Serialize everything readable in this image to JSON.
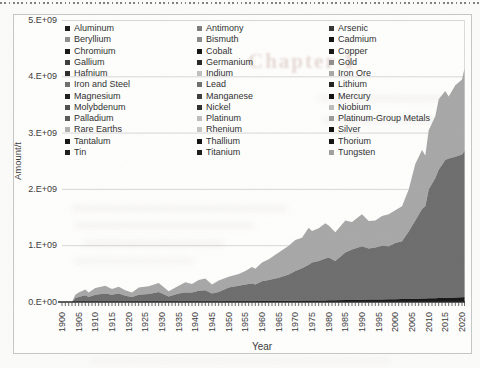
{
  "page": {
    "ghost_text": "Chapter 1"
  },
  "chart": {
    "y_axis": {
      "title": "Amount/t",
      "tick_labels": [
        "0.E+00",
        "1.E+09",
        "2.E+09",
        "3.E+09",
        "4.E+09",
        "5.E+09"
      ],
      "tick_values": [
        0,
        1,
        2,
        3,
        4,
        5
      ]
    },
    "x_axis": {
      "title": "Year",
      "tick_labels": [
        "1900",
        "1905",
        "1910",
        "1915",
        "1920",
        "1925",
        "1930",
        "1935",
        "1940",
        "1945",
        "1950",
        "1955",
        "1960",
        "1965",
        "1970",
        "1975",
        "1980",
        "1985",
        "1990",
        "1995",
        "2000",
        "2005",
        "2010",
        "2015",
        "2020"
      ]
    },
    "legend": {
      "columns": [
        [
          {
            "label": "Aluminum",
            "color": "#1a1a1a"
          },
          {
            "label": "Beryllium",
            "color": "#8f8f8f"
          },
          {
            "label": "Chromium",
            "color": "#161616"
          },
          {
            "label": "Gallium",
            "color": "#3d3d3d"
          },
          {
            "label": "Hafnium",
            "color": "#2b2b2b"
          },
          {
            "label": "Iron and Steel",
            "color": "#6f6f6f"
          },
          {
            "label": "Magnesium",
            "color": "#1f1f1f"
          },
          {
            "label": "Molybdenum",
            "color": "#4f4f4f"
          },
          {
            "label": "Palladium",
            "color": "#5a5a5a"
          },
          {
            "label": "Rare Earths",
            "color": "#b0b0b0"
          },
          {
            "label": "Tantalum",
            "color": "#141414"
          },
          {
            "label": "Tin",
            "color": "#1c1c1c"
          }
        ],
        [
          {
            "label": "Antimony",
            "color": "#7d7d7d"
          },
          {
            "label": "Bismuth",
            "color": "#8a8a8a"
          },
          {
            "label": "Cobalt",
            "color": "#121212"
          },
          {
            "label": "Germanium",
            "color": "#262626"
          },
          {
            "label": "Indium",
            "color": "#c0c0c0"
          },
          {
            "label": "Lead",
            "color": "#6f6f6f"
          },
          {
            "label": "Manganese",
            "color": "#3c3c3c"
          },
          {
            "label": "Nickel",
            "color": "#2f2f2f"
          },
          {
            "label": "Platinum",
            "color": "#bdbdbd"
          },
          {
            "label": "Rhenium",
            "color": "#c4c4c4"
          },
          {
            "label": "Thallium",
            "color": "#101010"
          },
          {
            "label": "Titanium",
            "color": "#1b1b1b"
          }
        ],
        [
          {
            "label": "Arsenic",
            "color": "#353535"
          },
          {
            "label": "Cadmium",
            "color": "#101010"
          },
          {
            "label": "Copper",
            "color": "#141414"
          },
          {
            "label": "Gold",
            "color": "#8f8f8f"
          },
          {
            "label": "Iron Ore",
            "color": "#a8a8a8"
          },
          {
            "label": "Lithium",
            "color": "#202020"
          },
          {
            "label": "Mercury",
            "color": "#0f0f0f"
          },
          {
            "label": "Niobium",
            "color": "#bdbdbd"
          },
          {
            "label": "Platinum-Group Metals",
            "color": "#9a9a9a"
          },
          {
            "label": "Silver",
            "color": "#0d0d0d"
          },
          {
            "label": "Thorium",
            "color": "#121212"
          },
          {
            "label": "Tungsten",
            "color": "#9f9f9f"
          }
        ]
      ]
    }
  },
  "chart_data": {
    "type": "area",
    "stacked": true,
    "title": "",
    "xlabel": "Year",
    "ylabel": "Amount/t",
    "xlim": [
      1900,
      2021
    ],
    "ylim": [
      0,
      5000000000
    ],
    "y_tick_format": "0.E+00",
    "values_unit": "1e9 tonnes",
    "grid": true,
    "legend_position": "inside-top",
    "legend_entries": [
      "Aluminum",
      "Antimony",
      "Arsenic",
      "Beryllium",
      "Bismuth",
      "Cadmium",
      "Chromium",
      "Cobalt",
      "Copper",
      "Gallium",
      "Germanium",
      "Gold",
      "Hafnium",
      "Indium",
      "Iron and Steel",
      "Iron Ore",
      "Lead",
      "Lithium",
      "Magnesium",
      "Manganese",
      "Mercury",
      "Molybdenum",
      "Nickel",
      "Niobium",
      "Palladium",
      "Platinum",
      "Platinum-Group Metals",
      "Rare Earths",
      "Rhenium",
      "Silver",
      "Tantalum",
      "Thallium",
      "Thorium",
      "Tin",
      "Titanium",
      "Tungsten"
    ],
    "note": "36 stacked series in legend; only three bands are visually resolvable in the plot (values estimated from pixels, in 1e9 t): thin black bottom band (Aluminum and other minor metals), dark gray Iron and Steel, light gray Iron Ore.",
    "x": [
      1900,
      1903,
      1904,
      1905,
      1907,
      1908,
      1910,
      1913,
      1915,
      1917,
      1919,
      1921,
      1923,
      1926,
      1929,
      1932,
      1935,
      1937,
      1939,
      1941,
      1943,
      1945,
      1947,
      1950,
      1953,
      1955,
      1957,
      1958,
      1960,
      1962,
      1965,
      1968,
      1970,
      1972,
      1974,
      1975,
      1977,
      1979,
      1980,
      1982,
      1985,
      1987,
      1990,
      1992,
      1994,
      1996,
      1998,
      2000,
      2002,
      2004,
      2006,
      2008,
      2009,
      2010,
      2012,
      2013,
      2015,
      2016,
      2018,
      2020,
      2021
    ],
    "series": [
      {
        "name": "Other metals (bottom black band)",
        "color": "#151515",
        "values": [
          0,
          0,
          0.005,
          0.005,
          0.005,
          0.005,
          0.006,
          0.006,
          0.006,
          0.006,
          0.006,
          0.007,
          0.007,
          0.007,
          0.008,
          0.008,
          0.009,
          0.009,
          0.01,
          0.01,
          0.01,
          0.011,
          0.011,
          0.012,
          0.013,
          0.014,
          0.015,
          0.015,
          0.016,
          0.017,
          0.019,
          0.021,
          0.022,
          0.024,
          0.026,
          0.027,
          0.028,
          0.029,
          0.03,
          0.032,
          0.035,
          0.037,
          0.04,
          0.042,
          0.044,
          0.046,
          0.048,
          0.05,
          0.052,
          0.054,
          0.057,
          0.06,
          0.062,
          0.065,
          0.068,
          0.07,
          0.075,
          0.077,
          0.08,
          0.085,
          0.09
        ]
      },
      {
        "name": "Iron and Steel",
        "color": "#6d6d6d",
        "values": [
          0,
          0,
          0.065,
          0.085,
          0.115,
          0.085,
          0.124,
          0.144,
          0.124,
          0.144,
          0.104,
          0.083,
          0.123,
          0.133,
          0.172,
          0.092,
          0.141,
          0.161,
          0.16,
          0.19,
          0.2,
          0.139,
          0.169,
          0.248,
          0.277,
          0.296,
          0.315,
          0.295,
          0.354,
          0.373,
          0.411,
          0.469,
          0.528,
          0.576,
          0.634,
          0.673,
          0.702,
          0.741,
          0.76,
          0.698,
          0.845,
          0.893,
          0.95,
          0.908,
          0.926,
          0.954,
          0.942,
          1.0,
          1.028,
          1.196,
          1.393,
          1.59,
          1.638,
          1.935,
          2.132,
          2.28,
          2.445,
          2.473,
          2.5,
          2.535,
          2.59
        ]
      },
      {
        "name": "Iron Ore",
        "color": "#a7a7a7",
        "values": [
          0,
          0,
          0.06,
          0.08,
          0.1,
          0.08,
          0.12,
          0.14,
          0.1,
          0.12,
          0.1,
          0.08,
          0.13,
          0.14,
          0.16,
          0.09,
          0.14,
          0.18,
          0.15,
          0.19,
          0.21,
          0.16,
          0.2,
          0.19,
          0.21,
          0.24,
          0.29,
          0.28,
          0.33,
          0.37,
          0.45,
          0.51,
          0.55,
          0.54,
          0.66,
          0.56,
          0.58,
          0.63,
          0.57,
          0.51,
          0.57,
          0.49,
          0.57,
          0.49,
          0.48,
          0.53,
          0.57,
          0.58,
          0.62,
          0.75,
          1.0,
          1.05,
          0.9,
          1.05,
          1.1,
          1.25,
          1.23,
          1.1,
          1.27,
          1.33,
          1.47
        ]
      }
    ]
  }
}
